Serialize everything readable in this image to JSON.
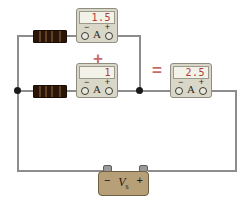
{
  "diagram": {
    "colors": {
      "wire": "#8d8d8d",
      "node": "#1a1a1a",
      "resistor_body": "#2b1508",
      "meter_case": "#d9d7c8",
      "lcd_face": "#f3f2e8",
      "lcd_digits": "#b03a3a",
      "operator": "#c96a6a",
      "battery_body": "#b7a077"
    }
  },
  "meters": [
    {
      "id": "ammeter-top",
      "reading": "1.5",
      "unit_letter": "A",
      "negative_terminal": "−",
      "positive_terminal": "+"
    },
    {
      "id": "ammeter-middle",
      "reading": "1",
      "unit_letter": "A",
      "negative_terminal": "−",
      "positive_terminal": "+"
    },
    {
      "id": "ammeter-total",
      "reading": "2.5",
      "unit_letter": "A",
      "negative_terminal": "−",
      "positive_terminal": "+"
    }
  ],
  "operators": {
    "plus": "+",
    "equals": "="
  },
  "source": {
    "label_main": "V",
    "label_sub": "s",
    "negative_sign": "−",
    "positive_sign": "+"
  },
  "components": {
    "resistor_top": "resistor",
    "resistor_bottom": "resistor"
  }
}
